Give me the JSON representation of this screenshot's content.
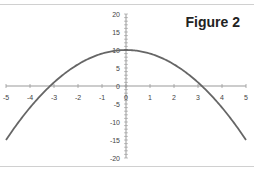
{
  "chart_data": {
    "type": "line",
    "title": "Figure 2",
    "xlabel": "",
    "ylabel": "",
    "xlim": [
      -5,
      5
    ],
    "ylim": [
      -20,
      20
    ],
    "x_ticks": [
      -5,
      -4,
      -3,
      -2,
      -1,
      0,
      1,
      2,
      3,
      4,
      5
    ],
    "y_ticks": [
      -20,
      -15,
      -10,
      -5,
      0,
      5,
      10,
      15,
      20
    ],
    "grid": false,
    "legend": null,
    "series": [
      {
        "name": "y = 10 - x^2",
        "x": [
          -5,
          -4.5,
          -4,
          -3.5,
          -3,
          -2.5,
          -2,
          -1.5,
          -1,
          -0.5,
          0,
          0.5,
          1,
          1.5,
          2,
          2.5,
          3,
          3.5,
          4,
          4.5,
          5
        ],
        "values": [
          -15,
          -10.25,
          -6,
          -2.25,
          1,
          3.75,
          6,
          7.75,
          9,
          9.75,
          10,
          9.75,
          9,
          7.75,
          6,
          3.75,
          1,
          -2.25,
          -6,
          -10.25,
          -15
        ],
        "color": "#666666"
      }
    ]
  },
  "colors": {
    "axis": "#999999",
    "curve": "#666666",
    "text": "#444444"
  }
}
